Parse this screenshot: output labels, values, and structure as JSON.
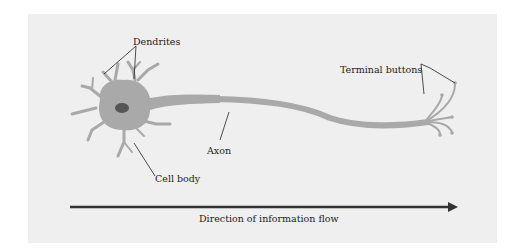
{
  "diagram": {
    "labels": {
      "dendrites": "Dendrites",
      "terminal_buttons": "Terminal buttons",
      "axon": "Axon",
      "cell_body": "Cell body",
      "flow": "Direction of information flow"
    },
    "colors": {
      "background": "#efefef",
      "neuron": "#a9a9a9",
      "nucleus": "#555555",
      "arrow": "#333333",
      "leader_lines": "#222222"
    }
  }
}
